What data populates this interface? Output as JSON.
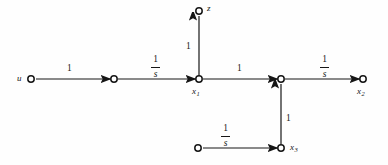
{
  "figure": {
    "kind": "signal-flow-graph",
    "background_color": "#fefefe",
    "stroke_color": "#161616",
    "node_fill": "#ffffff"
  },
  "nodes": {
    "input_u": {
      "label": "u",
      "x": 31,
      "y": 79
    },
    "mid_left": {
      "label": "",
      "x": 114,
      "y": 79
    },
    "x1": {
      "label": "x",
      "sub": "1",
      "x": 199,
      "y": 79
    },
    "z": {
      "label": "z",
      "x": 199,
      "y": 11
    },
    "sum_right": {
      "label": "",
      "x": 281,
      "y": 79
    },
    "x2": {
      "label": "x",
      "sub": "2",
      "x": 363,
      "y": 79
    },
    "src_bottom": {
      "label": "",
      "x": 198,
      "y": 148
    },
    "x3": {
      "label": "x",
      "sub": "3",
      "x": 281,
      "y": 148
    }
  },
  "node_labels": [
    {
      "name": "node-label-u",
      "text": "u",
      "sub": "",
      "x": 17,
      "y": 74
    },
    {
      "name": "node-label-z",
      "text": "z",
      "sub": "",
      "x": 207,
      "y": 4
    },
    {
      "name": "node-label-x1",
      "text": "x",
      "sub": "1",
      "x": 192,
      "y": 87
    },
    {
      "name": "node-label-x2",
      "text": "x",
      "sub": "2",
      "x": 357,
      "y": 87
    },
    {
      "name": "node-label-x3",
      "text": "x",
      "sub": "3",
      "x": 290,
      "y": 143
    }
  ],
  "edge_gains": [
    {
      "name": "gain-u-to-mid",
      "type": "scalar",
      "text": "1",
      "x": 67,
      "y": 64
    },
    {
      "name": "gain-mid-to-x1",
      "type": "fraction",
      "num": "1",
      "den": "s",
      "x": 151,
      "y": 55
    },
    {
      "name": "gain-x1-to-z",
      "type": "scalar",
      "text": "1",
      "x": 186,
      "y": 42
    },
    {
      "name": "gain-x1-to-sum",
      "type": "scalar",
      "text": "1",
      "x": 237,
      "y": 64
    },
    {
      "name": "gain-sum-to-x2",
      "type": "fraction",
      "num": "1",
      "den": "s",
      "x": 320,
      "y": 55
    },
    {
      "name": "gain-x3-to-sum",
      "type": "scalar",
      "text": "1",
      "x": 286,
      "y": 114
    },
    {
      "name": "gain-src-to-x3",
      "type": "fraction",
      "num": "1",
      "den": "s",
      "x": 221,
      "y": 124
    }
  ],
  "edges": [
    {
      "name": "edge-u-to-mid",
      "from": "input_u",
      "to": "mid_left",
      "gain": "1",
      "direction": "right"
    },
    {
      "name": "edge-mid-to-x1",
      "from": "mid_left",
      "to": "x1",
      "gain": "1/s",
      "direction": "right"
    },
    {
      "name": "edge-x1-to-z",
      "from": "x1",
      "to": "z",
      "gain": "1",
      "direction": "up"
    },
    {
      "name": "edge-x1-to-sum",
      "from": "x1",
      "to": "sum_right",
      "gain": "1",
      "direction": "right"
    },
    {
      "name": "edge-sum-to-x2",
      "from": "sum_right",
      "to": "x2",
      "gain": "1/s",
      "direction": "right"
    },
    {
      "name": "edge-x3-to-sum",
      "from": "x3",
      "to": "sum_right",
      "gain": "1",
      "direction": "up"
    },
    {
      "name": "edge-src-to-x3",
      "from": "src_bottom",
      "to": "x3",
      "gain": "1/s",
      "direction": "right"
    }
  ]
}
